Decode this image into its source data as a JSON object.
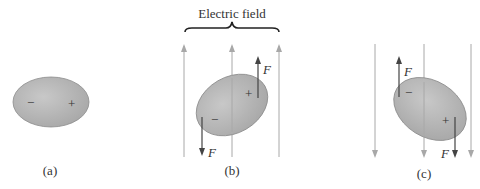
{
  "title": "Electric field",
  "panels": [
    {
      "id": "a",
      "caption": "(a)",
      "negative_sign": "−",
      "positive_sign": "+",
      "field": "none"
    },
    {
      "id": "b",
      "caption": "(b)",
      "negative_sign": "−",
      "positive_sign": "+",
      "field": "up",
      "force_up_label": "F",
      "force_down_label": "F"
    },
    {
      "id": "c",
      "caption": "(c)",
      "negative_sign": "−",
      "positive_sign": "+",
      "field": "down",
      "force_up_label": "F",
      "force_down_label": "F"
    }
  ],
  "colors": {
    "field_line": "#a8a8a8",
    "force_arrow": "#444444",
    "molecule_fill": "#b5b5b5",
    "molecule_stroke": "#888888"
  }
}
